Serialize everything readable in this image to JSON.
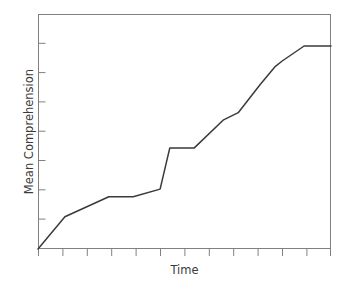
{
  "figure": {
    "caption_remnant": "",
    "background_color": "#ffffff",
    "frame_color": "#808080",
    "line_color": "#3a3a3a",
    "text_color": "#3b3b3b"
  },
  "chart_data": {
    "type": "line",
    "title": "",
    "xlabel": "Time",
    "ylabel": "Mean Comprehension",
    "grid": false,
    "legend": false,
    "xlim": [
      0,
      12
    ],
    "ylim": [
      0,
      10
    ],
    "x_tick_count": 12,
    "y_tick_count": 8,
    "x_tick_labels": [],
    "y_tick_labels": [],
    "series": [
      {
        "name": "Mean Comprehension",
        "x": [
          0.0,
          1.1,
          2.9,
          3.9,
          5.0,
          5.4,
          6.4,
          7.6,
          8.2,
          9.1,
          9.7,
          10.0,
          10.9,
          12.0
        ],
        "y": [
          0.0,
          1.37,
          2.22,
          2.22,
          2.55,
          4.3,
          4.3,
          5.5,
          5.8,
          7.0,
          7.75,
          8.0,
          8.64,
          8.64
        ]
      }
    ]
  }
}
